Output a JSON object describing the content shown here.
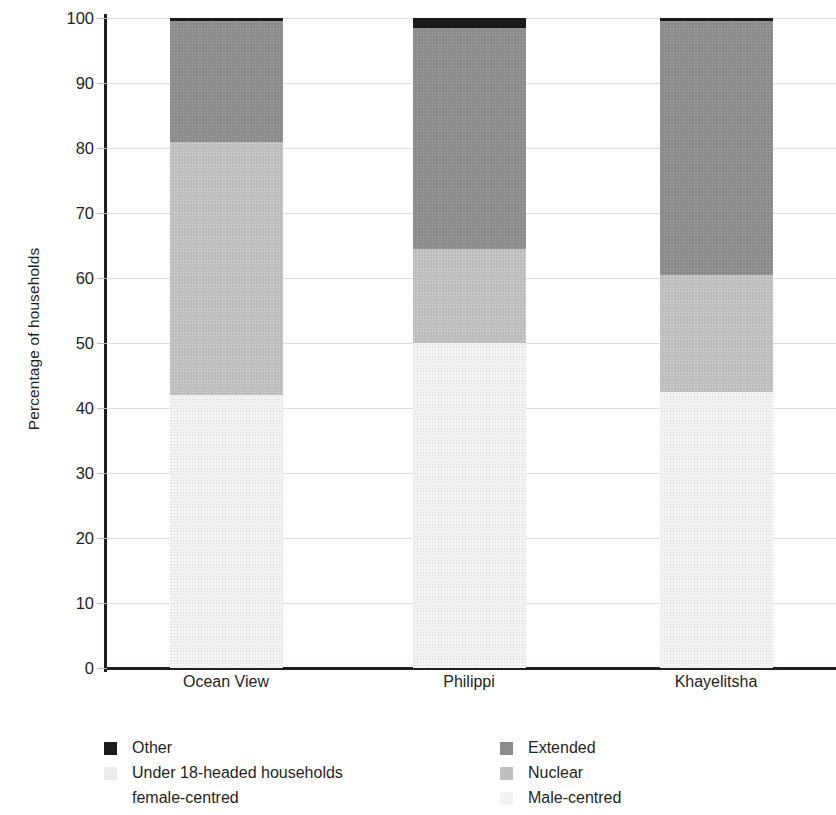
{
  "axes": {
    "ylabel": "Percentage of households",
    "yticks": [
      0,
      10,
      20,
      30,
      40,
      50,
      60,
      70,
      80,
      90,
      100
    ]
  },
  "legend": {
    "left": [
      {
        "label": "Other",
        "color": "#1a1a1a",
        "swatch": true
      },
      {
        "label": "Under 18-headed households",
        "color": "#ededed",
        "swatch": true
      },
      {
        "label": "female-centred",
        "color": "#f7f7f7",
        "swatch": false
      }
    ],
    "right": [
      {
        "label": "Extended",
        "color": "#8c8c8c",
        "swatch": true
      },
      {
        "label": "Nuclear",
        "color": "#bebebe",
        "swatch": true
      },
      {
        "label": "Male-centred",
        "color": "#f3f3f3",
        "swatch": true
      }
    ]
  },
  "chart_data": {
    "type": "bar",
    "title": "",
    "xlabel": "",
    "ylabel": "Percentage of households",
    "ylim": [
      0,
      100
    ],
    "grid": true,
    "stacked": true,
    "legend_position": "bottom",
    "categories": [
      "Ocean View",
      "Philippi",
      "Khayelitsha"
    ],
    "series": [
      {
        "name": "Male-centred",
        "color": "#f3f3f3",
        "values": [
          42.0,
          50.0,
          42.5
        ]
      },
      {
        "name": "Nuclear",
        "color": "#bebebe",
        "values": [
          39.0,
          14.5,
          18.0
        ]
      },
      {
        "name": "Extended",
        "color": "#8c8c8c",
        "values": [
          18.5,
          34.0,
          39.0
        ]
      },
      {
        "name": "Other",
        "color": "#1a1a1a",
        "values": [
          0.5,
          1.5,
          0.5
        ]
      }
    ],
    "cumulative_tops": {
      "Ocean View": {
        "Male-centred": 42.0,
        "Nuclear": 81.0,
        "Extended": 99.5,
        "Other": 100
      },
      "Philippi": {
        "Male-centred": 50.0,
        "Nuclear": 64.5,
        "Extended": 98.5,
        "Other": 100
      },
      "Khayelitsha": {
        "Male-centred": 42.5,
        "Nuclear": 60.5,
        "Extended": 99.5,
        "Other": 100
      }
    }
  }
}
